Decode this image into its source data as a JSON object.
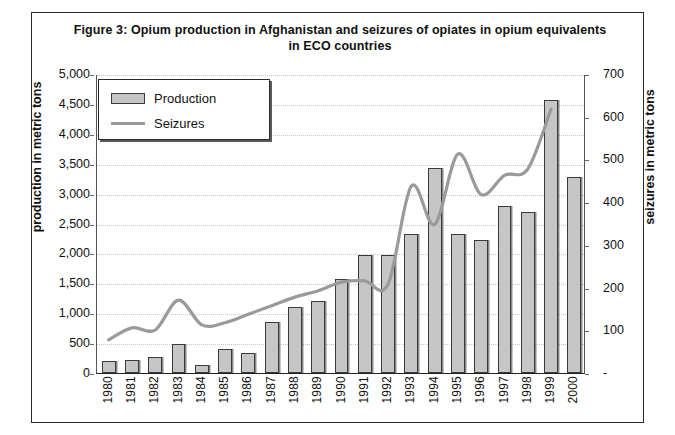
{
  "figure": {
    "title": "Figure 3: Opium production in Afghanistan and seizures of opiates in opium equivalents in ECO countries"
  },
  "legend": {
    "production_label": "Production",
    "seizures_label": "Seizures"
  },
  "axes": {
    "left_title": "production in metric tons",
    "right_title": "seizures in metric tons"
  },
  "colors": {
    "bar_fill": "#c6c6c6",
    "bar_stroke": "#3a3a3a",
    "line": "#9a9a9a",
    "frame": "#2a2a2a",
    "text": "#111111",
    "grid": "#c9c9c9"
  },
  "chart_data": {
    "type": "bar",
    "title": "Figure 3: Opium production in Afghanistan and seizures of opiates in opium equivalents in ECO countries",
    "xlabel": "",
    "ylabel": "production in metric tons",
    "y2label": "seizures in metric tons",
    "grid": true,
    "legend_position": "top-left",
    "categories": [
      "1980",
      "1981",
      "1982",
      "1983",
      "1984",
      "1985",
      "1986",
      "1987",
      "1988",
      "1989",
      "1990",
      "1991",
      "1992",
      "1993",
      "1994",
      "1995",
      "1996",
      "1997",
      "1998",
      "1999",
      "2000"
    ],
    "ylim": [
      0,
      5000
    ],
    "yticks": [
      "0",
      "500",
      "1,000",
      "1,500",
      "2,000",
      "2,500",
      "3,000",
      "3,500",
      "4,000",
      "4,500",
      "5,000"
    ],
    "y2lim": [
      0,
      700
    ],
    "y2ticks": [
      "-",
      "100",
      "200",
      "300",
      "400",
      "500",
      "600",
      "700"
    ],
    "series": [
      {
        "name": "Production",
        "type": "bar",
        "axis": "left",
        "unit": "metric tons",
        "values": [
          200,
          225,
          270,
          480,
          140,
          400,
          330,
          850,
          1100,
          1200,
          1570,
          1980,
          1970,
          2330,
          3420,
          2330,
          2230,
          2790,
          2690,
          4565,
          3280
        ]
      },
      {
        "name": "Seizures",
        "type": "line",
        "axis": "right",
        "unit": "metric tons",
        "values": [
          80,
          108,
          103,
          173,
          115,
          120,
          140,
          160,
          180,
          195,
          215,
          218,
          210,
          440,
          350,
          515,
          420,
          465,
          480,
          620,
          null
        ]
      }
    ]
  }
}
